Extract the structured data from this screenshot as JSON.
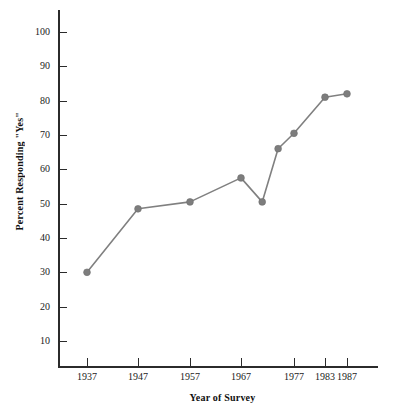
{
  "chart_data": {
    "type": "line",
    "title": "",
    "xlabel": "Year of Survey",
    "ylabel": "Percent Responding \"Yes\"",
    "x": [
      1937,
      1947,
      1957,
      1967,
      1971,
      1974,
      1977,
      1983,
      1987
    ],
    "values": [
      30,
      48.5,
      50.5,
      57.5,
      50.5,
      66,
      70.5,
      81,
      82
    ],
    "xtick_labels": [
      "1937",
      "1947",
      "1957",
      "1967",
      "1977",
      "1983",
      "1987"
    ],
    "xtick_values": [
      1937,
      1947,
      1957,
      1967,
      1977,
      1983,
      1987
    ],
    "ytick_labels": [
      "100",
      "90",
      "80",
      "70",
      "60",
      "50",
      "40",
      "30",
      "20",
      "10"
    ],
    "ytick_values": [
      100,
      90,
      80,
      70,
      60,
      50,
      40,
      30,
      20,
      10
    ],
    "ylim": [
      0,
      105
    ],
    "grid": false,
    "legend": false,
    "series_color": "#808080",
    "axis_color": "#2b2b2b",
    "text_color": "#1a1a1a"
  }
}
